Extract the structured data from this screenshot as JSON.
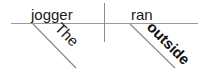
{
  "diagram": {
    "type": "sentence-diagram",
    "style": "Reed-Kellogg",
    "sentence": "The jogger ran outside",
    "baseline": {
      "subject": "jogger",
      "predicate": "ran"
    },
    "modifiers": [
      {
        "word": "The",
        "modifies": "jogger",
        "role": "article"
      },
      {
        "word": "outside",
        "modifies": "ran",
        "role": "adverb"
      }
    ],
    "colors": {
      "text": "#1a1a1a",
      "lines": "#9a9a9a"
    }
  }
}
